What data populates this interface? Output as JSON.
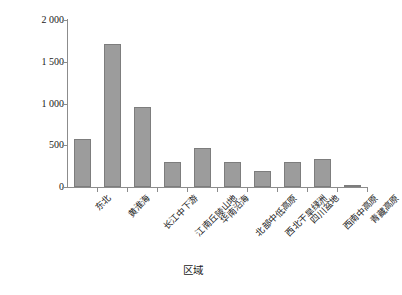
{
  "chart_data": {
    "type": "bar",
    "title": "",
    "xlabel": "区域",
    "ylabel": "化肥施用量（万t）",
    "categories": [
      "东北",
      "黄淮海",
      "长江中下游",
      "江南丘陵山地",
      "华南沿海",
      "北部中低高原",
      "西北干旱绿洲",
      "四川盆地",
      "西南中高原",
      "青藏高原"
    ],
    "values": [
      580,
      1710,
      955,
      300,
      470,
      300,
      195,
      295,
      340,
      20
    ],
    "ylim": [
      0,
      2000
    ],
    "yticks": [
      0,
      500,
      1000,
      1500,
      2000
    ],
    "ytick_labels": [
      "0",
      "500",
      "1 000",
      "1 500",
      "2 000"
    ],
    "grid": false,
    "legend": null,
    "bar_fill_color": "#9c9c9c",
    "bar_border_color": "#7d7d7d",
    "axis_color": "#8c8c8c"
  }
}
